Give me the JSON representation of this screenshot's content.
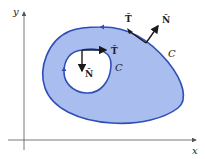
{
  "diagram": {
    "axes": {
      "x_label": "x",
      "y_label": "y"
    },
    "outer_curve": {
      "label": "C",
      "tangent_label": "T̂",
      "normal_label": "N̂"
    },
    "inner_curve": {
      "label": "C",
      "tangent_label": "T̂",
      "normal_label": "N̂"
    },
    "colors": {
      "region_fill": "#a9bdef",
      "curve_stroke": "#2f4fb5",
      "axis": "#555555",
      "vector": "#1a1a1a"
    }
  }
}
